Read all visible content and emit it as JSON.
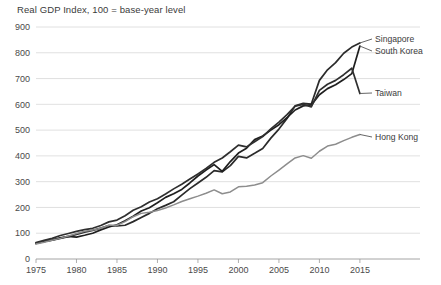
{
  "chart_data": {
    "type": "line",
    "title": "Real GDP Index, 100 = base-year level",
    "xlabel": "",
    "ylabel": "",
    "xlim": [
      1975,
      2016
    ],
    "ylim": [
      0,
      900
    ],
    "ytick_values": [
      0,
      100,
      200,
      300,
      400,
      500,
      600,
      700,
      800,
      900
    ],
    "ytick_labels": [
      "0",
      "100",
      "200",
      "300",
      "400",
      "500",
      "600",
      "700",
      "800",
      "900"
    ],
    "xtick_values": [
      1975,
      1980,
      1985,
      1990,
      1995,
      2000,
      2005,
      2010,
      2015
    ],
    "xtick_labels": [
      "1975",
      "1980",
      "1985",
      "1990",
      "1995",
      "2000",
      "2005",
      "2010",
      "2015"
    ],
    "grid": "horizontal",
    "legend_position": "inline-right-of-line-end",
    "x": [
      1975,
      1976,
      1977,
      1978,
      1979,
      1980,
      1981,
      1982,
      1983,
      1984,
      1985,
      1986,
      1987,
      1988,
      1989,
      1990,
      1991,
      1992,
      1993,
      1994,
      1995,
      1996,
      1997,
      1998,
      1999,
      2000,
      2001,
      2002,
      2003,
      2004,
      2005,
      2006,
      2007,
      2008,
      2009,
      2010,
      2011,
      2012,
      2013,
      2014,
      2015
    ],
    "series": [
      {
        "name": "Singapore",
        "color": "#2b2b2b",
        "label_color": "#3b3b3b",
        "values": [
          62,
          68,
          73,
          80,
          87,
          95,
          104,
          111,
          120,
          130,
          128,
          131,
          145,
          161,
          177,
          195,
          208,
          222,
          248,
          273,
          295,
          317,
          343,
          338,
          362,
          398,
          392,
          410,
          429,
          469,
          504,
          545,
          594,
          604,
          601,
          693,
          734,
          762,
          798,
          822,
          838
        ],
        "endpoint_value": 838
      },
      {
        "name": "South Korea",
        "color": "#1f1f1f",
        "label_color": "#3b3b3b",
        "values": [
          60,
          67,
          74,
          82,
          88,
          85,
          92,
          100,
          113,
          124,
          133,
          148,
          166,
          186,
          199,
          218,
          239,
          253,
          270,
          295,
          322,
          345,
          366,
          340,
          378,
          411,
          430,
          463,
          477,
          500,
          521,
          548,
          578,
          594,
          598,
          637,
          661,
          676,
          696,
          719,
          838
        ],
        "endpoint_value": 826
      },
      {
        "name": "Taiwan",
        "color": "#2f2f2f",
        "label_color": "#3b3b3b",
        "values": [
          64,
          72,
          80,
          91,
          99,
          107,
          114,
          119,
          130,
          144,
          151,
          168,
          189,
          203,
          221,
          234,
          252,
          272,
          290,
          310,
          330,
          351,
          375,
          392,
          416,
          442,
          435,
          455,
          475,
          505,
          531,
          560,
          593,
          600,
          590,
          654,
          678,
          693,
          715,
          740,
          642
        ],
        "endpoint_value": 642
      },
      {
        "name": "Hong Kong",
        "color": "#8d8d8d",
        "label_color": "#3b3b3b",
        "values": [
          58,
          65,
          73,
          80,
          89,
          99,
          108,
          112,
          119,
          131,
          131,
          145,
          164,
          177,
          181,
          188,
          198,
          210,
          223,
          234,
          244,
          255,
          268,
          253,
          260,
          280,
          282,
          287,
          296,
          322,
          345,
          369,
          392,
          401,
          391,
          418,
          438,
          445,
          459,
          472,
          483
        ],
        "endpoint_value": 483
      }
    ]
  }
}
